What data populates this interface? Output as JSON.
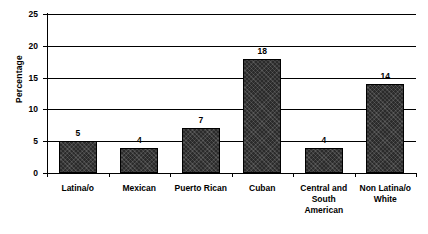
{
  "chart_data": {
    "type": "bar",
    "title": "",
    "subtitle": "",
    "xlabel": "",
    "ylabel": "Percentage",
    "categories": [
      "Latina/o",
      "Mexican",
      "Puerto Rican",
      "Cuban",
      "Central and South American",
      "Non Latina/o White"
    ],
    "category_lines": [
      [
        "Latina/o"
      ],
      [
        "Mexican"
      ],
      [
        "Puerto Rican"
      ],
      [
        "Cuban"
      ],
      [
        "Central and",
        "South",
        "American"
      ],
      [
        "Non Latina/o",
        "White"
      ]
    ],
    "values": [
      5,
      4,
      7,
      18,
      4,
      14
    ],
    "value_labels": [
      "5",
      "4",
      "7",
      "18",
      "4",
      "14"
    ],
    "ylim": [
      0,
      25
    ],
    "ytick_labels": [
      "0",
      "5",
      "10",
      "15",
      "20",
      "25"
    ],
    "ytick_values": [
      0,
      5,
      10,
      15,
      20,
      25
    ],
    "grid": true,
    "legend": false,
    "legend_position": "none",
    "bar_color": "#2b2b2b",
    "bar_border_color": "#000000",
    "axis_color": "#000000",
    "grid_color": "#000000",
    "background_color": "#ffffff",
    "text_color": "#000000"
  }
}
